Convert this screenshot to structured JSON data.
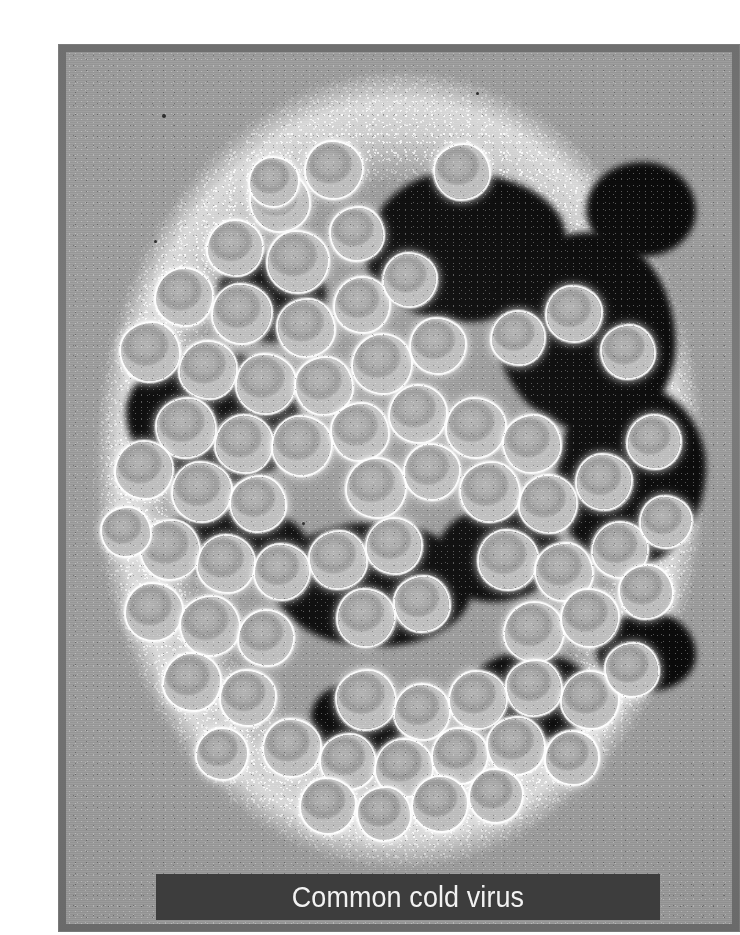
{
  "figure": {
    "caption": "Common cold virus",
    "alt": "Transmission electron micrograph of a cluster of common cold virus (rhinovirus) particles, negatively stained",
    "subject": "common cold virus",
    "imaging_technique": "transmission electron micrograph",
    "colors": {
      "paper": "#ffffff",
      "plate_border": "#6f6f6f",
      "micrograph_background": "#9b9b9b",
      "stain_dark": "#0a0a0a",
      "capsid_fill": "#a8a8a8",
      "capsid_rim": "#ffffff",
      "caption_band": "#3d3d3d",
      "caption_text": "#f2f2f2"
    },
    "layout": {
      "frame_left": 18,
      "frame_top": 28,
      "frame_width": 682,
      "frame_height": 888,
      "border_width": 8,
      "caption_band_left": 98,
      "caption_band_top": 830,
      "caption_band_width": 504,
      "caption_band_height": 46
    }
  },
  "chart_data": {
    "type": "scatter",
    "title": "Common cold virus",
    "xlabel": "",
    "ylabel": "",
    "note": "Positions and radii of visible virion particles in micrograph pixel coordinates (origin = top-left of micrograph canvas, 666x872 px).",
    "stain_pools": [
      {
        "x": 300,
        "y": 120,
        "w": 200,
        "h": 150,
        "r": "44% 56% 50% 50% / 56% 44% 56% 44%"
      },
      {
        "x": 430,
        "y": 180,
        "w": 180,
        "h": 200,
        "r": "52% 48% 44% 56% / 48% 56% 44% 52%"
      },
      {
        "x": 60,
        "y": 300,
        "w": 175,
        "h": 135,
        "r": "50% 50% 56% 44% / 44% 56% 44% 56%"
      },
      {
        "x": 490,
        "y": 330,
        "w": 150,
        "h": 185,
        "r": "46% 54% 52% 48% / 54% 46% 54% 46%"
      },
      {
        "x": 205,
        "y": 470,
        "w": 200,
        "h": 125,
        "r": "55% 45% 48% 52% / 45% 55% 45% 55%"
      },
      {
        "x": 370,
        "y": 455,
        "w": 125,
        "h": 95,
        "r": "48% 52% 55% 45% / 52% 45% 55% 48%"
      },
      {
        "x": 90,
        "y": 455,
        "w": 150,
        "h": 70,
        "r": "50% 50% 50% 50% / 50% 50% 50% 50%"
      },
      {
        "x": 520,
        "y": 110,
        "w": 110,
        "h": 95,
        "r": "52% 48% 50% 50% / 50% 52% 48% 50%"
      },
      {
        "x": 150,
        "y": 200,
        "w": 110,
        "h": 90,
        "r": "48% 52% 46% 54% / 54% 46% 54% 46%"
      },
      {
        "x": 400,
        "y": 600,
        "w": 130,
        "h": 90,
        "r": "46% 54% 52% 48% / 52% 48% 52% 48%"
      },
      {
        "x": 245,
        "y": 630,
        "w": 95,
        "h": 75,
        "r": "50% 50% 48% 52% / 48% 52% 50% 50%"
      },
      {
        "x": 530,
        "y": 560,
        "w": 100,
        "h": 80,
        "r": "54% 46% 50% 50% / 46% 54% 46% 54%"
      }
    ],
    "virions": [
      {
        "x": 268,
        "y": 118,
        "d": 56,
        "p": 1
      },
      {
        "x": 214,
        "y": 150,
        "d": 58,
        "p": 2
      },
      {
        "x": 169,
        "y": 196,
        "d": 54,
        "p": 3
      },
      {
        "x": 232,
        "y": 210,
        "d": 60,
        "p": 1
      },
      {
        "x": 291,
        "y": 182,
        "d": 52,
        "p": 2
      },
      {
        "x": 118,
        "y": 245,
        "d": 56,
        "p": 3
      },
      {
        "x": 176,
        "y": 262,
        "d": 58,
        "p": 1
      },
      {
        "x": 240,
        "y": 276,
        "d": 56,
        "p": 2
      },
      {
        "x": 296,
        "y": 253,
        "d": 54,
        "p": 3
      },
      {
        "x": 344,
        "y": 228,
        "d": 52,
        "p": 1
      },
      {
        "x": 84,
        "y": 300,
        "d": 58,
        "p": 2
      },
      {
        "x": 142,
        "y": 318,
        "d": 56,
        "p": 3
      },
      {
        "x": 200,
        "y": 332,
        "d": 58,
        "p": 1
      },
      {
        "x": 258,
        "y": 334,
        "d": 56,
        "p": 2
      },
      {
        "x": 316,
        "y": 312,
        "d": 58,
        "p": 3
      },
      {
        "x": 372,
        "y": 294,
        "d": 54,
        "p": 1
      },
      {
        "x": 120,
        "y": 376,
        "d": 58,
        "p": 2
      },
      {
        "x": 178,
        "y": 392,
        "d": 56,
        "p": 3
      },
      {
        "x": 236,
        "y": 394,
        "d": 58,
        "p": 1
      },
      {
        "x": 294,
        "y": 380,
        "d": 56,
        "p": 2
      },
      {
        "x": 352,
        "y": 362,
        "d": 56,
        "p": 3
      },
      {
        "x": 410,
        "y": 376,
        "d": 58,
        "p": 1
      },
      {
        "x": 466,
        "y": 392,
        "d": 56,
        "p": 2
      },
      {
        "x": 78,
        "y": 418,
        "d": 56,
        "p": 3
      },
      {
        "x": 136,
        "y": 440,
        "d": 58,
        "p": 1
      },
      {
        "x": 192,
        "y": 452,
        "d": 54,
        "p": 2
      },
      {
        "x": 310,
        "y": 436,
        "d": 58,
        "p": 3
      },
      {
        "x": 366,
        "y": 420,
        "d": 54,
        "p": 1
      },
      {
        "x": 424,
        "y": 440,
        "d": 58,
        "p": 2
      },
      {
        "x": 482,
        "y": 452,
        "d": 56,
        "p": 3
      },
      {
        "x": 538,
        "y": 430,
        "d": 54,
        "p": 1
      },
      {
        "x": 104,
        "y": 498,
        "d": 58,
        "p": 2
      },
      {
        "x": 160,
        "y": 512,
        "d": 56,
        "p": 3
      },
      {
        "x": 216,
        "y": 520,
        "d": 54,
        "p": 1
      },
      {
        "x": 272,
        "y": 508,
        "d": 56,
        "p": 2
      },
      {
        "x": 328,
        "y": 494,
        "d": 54,
        "p": 3
      },
      {
        "x": 442,
        "y": 508,
        "d": 58,
        "p": 1
      },
      {
        "x": 498,
        "y": 520,
        "d": 56,
        "p": 2
      },
      {
        "x": 554,
        "y": 498,
        "d": 54,
        "p": 3
      },
      {
        "x": 88,
        "y": 560,
        "d": 56,
        "p": 1
      },
      {
        "x": 144,
        "y": 574,
        "d": 58,
        "p": 2
      },
      {
        "x": 200,
        "y": 586,
        "d": 54,
        "p": 3
      },
      {
        "x": 300,
        "y": 566,
        "d": 56,
        "p": 1
      },
      {
        "x": 356,
        "y": 552,
        "d": 54,
        "p": 2
      },
      {
        "x": 468,
        "y": 580,
        "d": 58,
        "p": 3
      },
      {
        "x": 524,
        "y": 566,
        "d": 56,
        "p": 1
      },
      {
        "x": 580,
        "y": 540,
        "d": 52,
        "p": 2
      },
      {
        "x": 126,
        "y": 630,
        "d": 56,
        "p": 3
      },
      {
        "x": 182,
        "y": 646,
        "d": 54,
        "p": 1
      },
      {
        "x": 300,
        "y": 648,
        "d": 58,
        "p": 2
      },
      {
        "x": 356,
        "y": 660,
        "d": 54,
        "p": 3
      },
      {
        "x": 412,
        "y": 648,
        "d": 56,
        "p": 1
      },
      {
        "x": 468,
        "y": 636,
        "d": 54,
        "p": 2
      },
      {
        "x": 524,
        "y": 648,
        "d": 56,
        "p": 3
      },
      {
        "x": 226,
        "y": 696,
        "d": 56,
        "p": 1
      },
      {
        "x": 282,
        "y": 710,
        "d": 54,
        "p": 2
      },
      {
        "x": 338,
        "y": 716,
        "d": 56,
        "p": 3
      },
      {
        "x": 394,
        "y": 704,
        "d": 54,
        "p": 1
      },
      {
        "x": 450,
        "y": 694,
        "d": 56,
        "p": 2
      },
      {
        "x": 506,
        "y": 706,
        "d": 52,
        "p": 3
      },
      {
        "x": 262,
        "y": 754,
        "d": 54,
        "p": 1
      },
      {
        "x": 318,
        "y": 762,
        "d": 52,
        "p": 2
      },
      {
        "x": 374,
        "y": 752,
        "d": 54,
        "p": 3
      },
      {
        "x": 430,
        "y": 744,
        "d": 52,
        "p": 1
      },
      {
        "x": 396,
        "y": 120,
        "d": 54,
        "p": 2
      },
      {
        "x": 452,
        "y": 286,
        "d": 52,
        "p": 3
      },
      {
        "x": 508,
        "y": 262,
        "d": 54,
        "p": 1
      },
      {
        "x": 562,
        "y": 300,
        "d": 52,
        "p": 2
      },
      {
        "x": 588,
        "y": 390,
        "d": 52,
        "p": 3
      },
      {
        "x": 600,
        "y": 470,
        "d": 50,
        "p": 1
      },
      {
        "x": 566,
        "y": 618,
        "d": 52,
        "p": 2
      },
      {
        "x": 156,
        "y": 702,
        "d": 50,
        "p": 3
      },
      {
        "x": 208,
        "y": 130,
        "d": 48,
        "p": 1
      },
      {
        "x": 60,
        "y": 480,
        "d": 48,
        "p": 2
      }
    ],
    "specks": [
      {
        "x": 96,
        "y": 62,
        "d": 4
      },
      {
        "x": 88,
        "y": 188,
        "d": 3
      },
      {
        "x": 410,
        "y": 40,
        "d": 3
      },
      {
        "x": 236,
        "y": 470,
        "d": 3
      }
    ]
  }
}
